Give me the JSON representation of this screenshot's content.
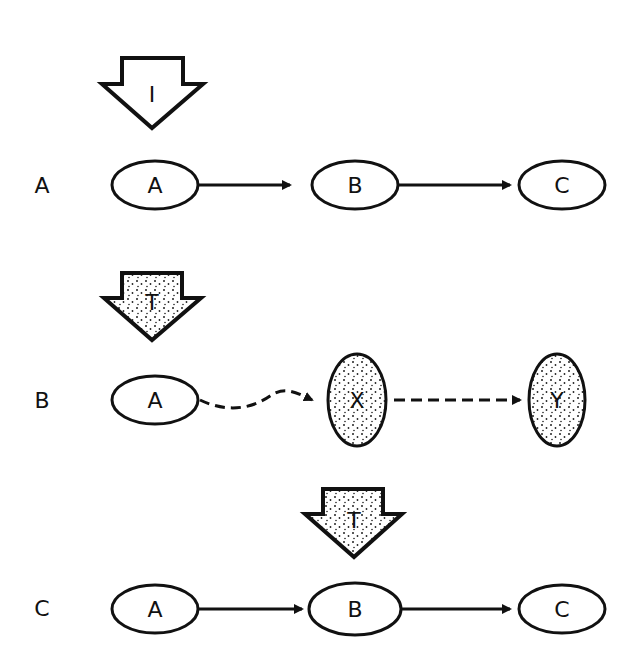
{
  "rows": [
    {
      "label": "A",
      "arrow_label": "I",
      "arrow_style": "plain",
      "nodes": [
        {
          "label": "A",
          "style": "plain"
        },
        {
          "label": "B",
          "style": "plain"
        },
        {
          "label": "C",
          "style": "plain"
        }
      ],
      "edges": [
        "solid",
        "solid"
      ]
    },
    {
      "label": "B",
      "arrow_label": "T",
      "arrow_style": "stippled",
      "nodes": [
        {
          "label": "A",
          "style": "plain"
        },
        {
          "label": "X",
          "style": "stippled"
        },
        {
          "label": "Y",
          "style": "stippled"
        }
      ],
      "edges": [
        "dashed-wavy",
        "dashed"
      ]
    },
    {
      "label": "C",
      "arrow_label": "T",
      "arrow_style": "stippled",
      "nodes": [
        {
          "label": "A",
          "style": "plain"
        },
        {
          "label": "B",
          "style": "plain"
        },
        {
          "label": "C",
          "style": "plain"
        }
      ],
      "edges": [
        "solid",
        "solid"
      ]
    }
  ]
}
